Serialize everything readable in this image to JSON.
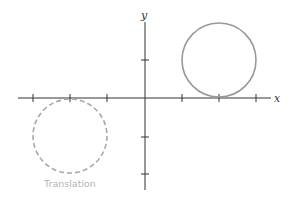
{
  "diagram": {
    "title": "",
    "axes": {
      "x_label": "x",
      "y_label": "y",
      "origin_px": [
        145,
        98
      ],
      "unit_px": 37,
      "x_ticks": [
        -3,
        -2,
        -1,
        1,
        2,
        3
      ],
      "y_ticks": [
        1,
        -1,
        -2
      ],
      "color": "#333333"
    },
    "shapes": [
      {
        "name": "original-circle",
        "type": "circle",
        "center": [
          2,
          1
        ],
        "radius": 1,
        "stroke": "#999999",
        "style": "solid"
      },
      {
        "name": "translated-circle",
        "type": "circle",
        "center": [
          -2,
          -1
        ],
        "radius": 1,
        "stroke": "#a8a8a8",
        "style": "dashed"
      }
    ],
    "caption": "Translation",
    "caption_color": "#b4b4b4"
  }
}
